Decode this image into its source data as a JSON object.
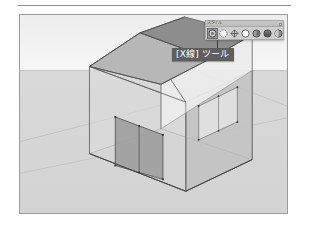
{
  "page": {
    "app": "SketchUp",
    "figure_caption": ""
  },
  "viewport": {
    "name": "3d-model-viewport",
    "sky_color": "#f2f2f2",
    "ground_color": "#d6d6d6",
    "model_name": "house-xray",
    "model_description": "Transparent X-ray view of a gabled house with a door opening and a window"
  },
  "toolbar": {
    "title": "スタイル",
    "close_label": "×",
    "buttons": [
      {
        "name": "xray-tool",
        "label": "[X線]",
        "selected": true
      },
      {
        "name": "back-edges-tool",
        "label": "背面のエッジ",
        "selected": false
      },
      {
        "name": "wireframe-tool",
        "label": "ワイヤフレーム",
        "selected": false
      },
      {
        "name": "hidden-line-tool",
        "label": "隠線",
        "selected": false
      },
      {
        "name": "shaded-tool",
        "label": "シェーディング",
        "selected": false
      },
      {
        "name": "shaded-texture-tool",
        "label": "テクスチャ",
        "selected": false
      },
      {
        "name": "monochrome-tool",
        "label": "モノクロ",
        "selected": false
      }
    ]
  },
  "callout": {
    "text": "[X線] ツール",
    "background": "#5e5e5e",
    "color": "#ffffff"
  },
  "model_colors": {
    "roof_left": "#b9b9b9",
    "roof_right": "#8f8f8f",
    "gable": "#e8e8e8",
    "wall_front": "#dcdcdc",
    "wall_right": "#c4c4c4",
    "floor": "#cfcfcf",
    "door": "#9e9e9e",
    "window": "#e2e2e2",
    "edge": "#4a4a4a"
  }
}
